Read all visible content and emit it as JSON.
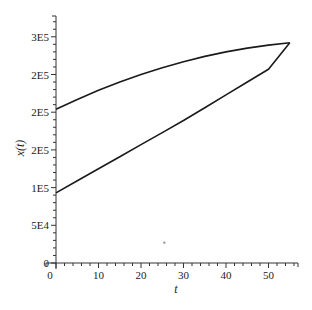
{
  "chart_data": {
    "type": "line",
    "title": "",
    "xlabel": "t",
    "ylabel": "x(t)",
    "xlim": [
      0,
      57
    ],
    "ylim": [
      0,
      330000
    ],
    "grid": false,
    "legend": null,
    "x_ticks": [
      {
        "value": 0,
        "label": "0"
      },
      {
        "value": 10,
        "label": "10"
      },
      {
        "value": 20,
        "label": "20"
      },
      {
        "value": 30,
        "label": "30"
      },
      {
        "value": 40,
        "label": "40"
      },
      {
        "value": 50,
        "label": "50"
      }
    ],
    "y_ticks": [
      {
        "value": 0,
        "label": "0"
      },
      {
        "value": 50000,
        "label": "5E4"
      },
      {
        "value": 100000,
        "label": "1E5"
      },
      {
        "value": 150000,
        "label": "2E5"
      },
      {
        "value": 200000,
        "label": "2E5"
      },
      {
        "value": 250000,
        "label": "2E5"
      },
      {
        "value": 300000,
        "label": "3E5"
      }
    ],
    "series": [
      {
        "name": "upper curve",
        "color": "#1a1a1a",
        "x": [
          0,
          5,
          10,
          15,
          20,
          25,
          30,
          35,
          40,
          45,
          50,
          55
        ],
        "y": [
          204000,
          217000,
          229000,
          240000,
          250000,
          259000,
          267000,
          274000,
          280000,
          285000,
          289000,
          292000
        ]
      },
      {
        "name": "lower curve",
        "color": "#1a1a1a",
        "x": [
          0,
          5,
          10,
          15,
          20,
          25,
          30,
          35,
          40,
          45,
          50,
          55
        ],
        "y": [
          93000,
          109000,
          125000,
          141000,
          157000,
          173000,
          189000,
          206000,
          223000,
          240000,
          257000,
          292000
        ]
      }
    ],
    "annotations": [
      {
        "type": "dot",
        "x": 25.5,
        "y": 27000,
        "color": "#8a8aa0"
      }
    ]
  }
}
